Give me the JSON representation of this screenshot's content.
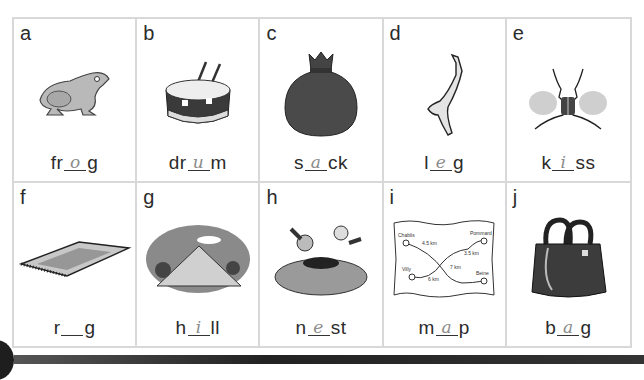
{
  "worksheet": {
    "cards": [
      {
        "letter": "a",
        "picture": "frog-icon",
        "prefix": "fr",
        "answer": "o",
        "suffix": "g"
      },
      {
        "letter": "b",
        "picture": "drum-icon",
        "prefix": "dr",
        "answer": "u",
        "suffix": "m"
      },
      {
        "letter": "c",
        "picture": "sack-icon",
        "prefix": "s",
        "answer": "a",
        "suffix": "ck"
      },
      {
        "letter": "d",
        "picture": "leg-icon",
        "prefix": "l",
        "answer": "e",
        "suffix": "g"
      },
      {
        "letter": "e",
        "picture": "kiss-icon",
        "prefix": "k",
        "answer": "i",
        "suffix": "ss"
      },
      {
        "letter": "f",
        "picture": "rug-icon",
        "prefix": "r",
        "answer": "",
        "suffix": "g"
      },
      {
        "letter": "g",
        "picture": "hill-icon",
        "prefix": "h",
        "answer": "i",
        "suffix": "ll"
      },
      {
        "letter": "h",
        "picture": "nest-icon",
        "prefix": "n",
        "answer": "e",
        "suffix": "st"
      },
      {
        "letter": "i",
        "picture": "map-icon",
        "prefix": "m",
        "answer": "a",
        "suffix": "p"
      },
      {
        "letter": "j",
        "picture": "bag-icon",
        "prefix": "b",
        "answer": "a",
        "suffix": "g"
      }
    ],
    "map_labels": [
      "Chablis",
      "4.5 km",
      "Pommard",
      "3.5 km",
      "Villy",
      "6 km",
      "7 km",
      "Beine"
    ]
  }
}
